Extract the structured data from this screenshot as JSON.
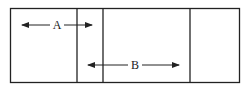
{
  "diagram": {
    "type": "partitioned-rectangle",
    "outer_box": {
      "x": 10,
      "y": 8,
      "width": 229,
      "height": 74
    },
    "dividers_x": [
      77,
      103,
      190
    ],
    "line_color": "#222222",
    "arrows": [
      {
        "label": "A",
        "y": 25,
        "x_start": 22,
        "x_end": 92,
        "direction": "both",
        "label_x": 57
      },
      {
        "label": "B",
        "y": 65,
        "x_start": 88,
        "x_end": 179,
        "direction": "both",
        "label_x": 135
      }
    ]
  }
}
